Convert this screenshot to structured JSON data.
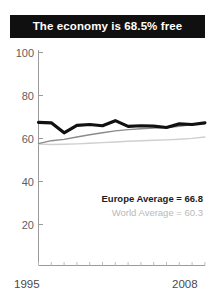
{
  "title": {
    "text": "The economy is 68.5% free"
  },
  "legend": {
    "europe": "Europe Average = 66.8",
    "world": "World Average = 60.3"
  },
  "axis": {
    "y_ticks": [
      "100",
      "80",
      "60",
      "40",
      "20"
    ],
    "x_start": "1995",
    "x_end": "2008"
  },
  "colors": {
    "banner_bg": "#101010",
    "banner_text": "#ffffff",
    "country_line": "#111111",
    "europe_line": "#8a8a8a",
    "world_line": "#cfcfcf",
    "axis": "#9a9a9a",
    "tick_label": "#5e5e5e"
  },
  "chart_data": {
    "type": "line",
    "title": "The economy is 68.5% free",
    "xlabel": "",
    "ylabel": "",
    "xlim": [
      1995,
      2008
    ],
    "ylim": [
      0,
      100
    ],
    "grid": false,
    "legend_position": "inside-bottom-right",
    "x": [
      1995,
      1996,
      1997,
      1998,
      1999,
      2000,
      2001,
      2002,
      2003,
      2004,
      2005,
      2006,
      2007,
      2008
    ],
    "series": [
      {
        "name": "Country",
        "color": "#111111",
        "width": "thick",
        "values": [
          67.2,
          67.0,
          62.3,
          65.8,
          66.2,
          65.6,
          68.0,
          65.3,
          65.6,
          65.4,
          64.8,
          66.5,
          66.2,
          67.0
        ]
      },
      {
        "name": "Europe Average",
        "color": "#8a8a8a",
        "width": "thin",
        "label_value": 66.8,
        "values": [
          57.2,
          58.6,
          59.2,
          60.3,
          61.4,
          62.3,
          63.2,
          63.8,
          64.2,
          64.5,
          64.8,
          65.4,
          66.2,
          66.8
        ]
      },
      {
        "name": "World Average",
        "color": "#cfcfcf",
        "width": "thin",
        "label_value": 60.3,
        "values": [
          57.0,
          56.8,
          56.9,
          57.1,
          57.4,
          57.7,
          58.0,
          58.3,
          58.6,
          58.8,
          59.0,
          59.3,
          59.7,
          60.3
        ]
      }
    ]
  }
}
